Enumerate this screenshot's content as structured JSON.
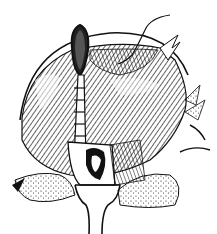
{
  "figure": {
    "colors": {
      "ink": "#111111",
      "paper": "#ffffff"
    },
    "elements": [
      "outer-arc",
      "tissue-mass",
      "clamp",
      "sutured-tube",
      "suture-thread",
      "retractor",
      "surrounding-tissue"
    ]
  }
}
